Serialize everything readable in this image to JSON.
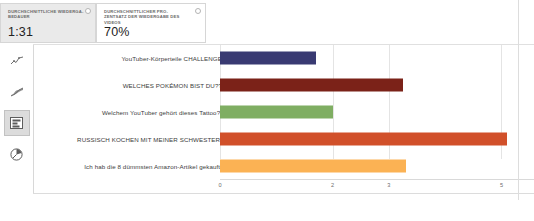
{
  "metrics": [
    {
      "title": "DURCHSCHNITTLICHE WIEDERGA-BEDAUER",
      "value": "1:31",
      "info_icon": "info-dot-icon"
    },
    {
      "title": "DURCHSCHNITTLICHER PRO-ZENTSATZ DER WIEDERGABE DES VIDEOS",
      "value": "70%",
      "info_icon": "info-dot-icon"
    }
  ],
  "sidebar": {
    "items": [
      {
        "icon": "line-chart-icon",
        "selected": false
      },
      {
        "icon": "area-chart-icon",
        "selected": false
      },
      {
        "icon": "bar-chart-icon",
        "selected": true
      },
      {
        "icon": "pie-chart-icon",
        "selected": false
      }
    ]
  },
  "chart_data": {
    "type": "bar",
    "orientation": "horizontal",
    "title": "",
    "xlabel": "",
    "ylabel": "",
    "xlim": [
      0,
      5.4
    ],
    "ticks": [
      "0",
      "2",
      "3",
      "5"
    ],
    "tick_values": [
      0,
      2,
      3,
      5
    ],
    "grid": true,
    "legend": "none",
    "categories": [
      "YouTuber-Körperteile CHALLENGE",
      "WELCHES POKÉMON BIST DU??",
      "Welchem YouTuber gehört dieses Tattoo?!",
      "RUSSISCH KOCHEN MIT MEINER SCHWESTER!",
      "Ich hab die 8 dümmsten Amazon-Artikel gekauft!"
    ],
    "values": [
      1.7,
      3.25,
      2.0,
      5.1,
      3.3
    ],
    "colors": [
      "#393a72",
      "#7b2218",
      "#7fae62",
      "#d1502a",
      "#fbb254"
    ]
  },
  "colors": {
    "card_bg": "#f3f3f3",
    "card_border": "#d6d6d6",
    "grid": "#e4e4e4",
    "text": "#3c3c3c",
    "muted": "#6e6e6e"
  }
}
